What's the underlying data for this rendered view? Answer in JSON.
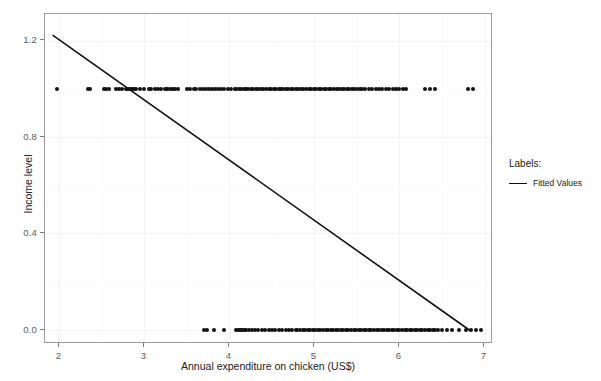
{
  "chart_data": {
    "type": "scatter",
    "title": "",
    "xlabel": "Annual expenditure on chicken (US$)",
    "ylabel": "Income level",
    "xlim": [
      1.83,
      7.1
    ],
    "ylim": [
      -0.06,
      1.31
    ],
    "xticks": [
      2,
      3,
      4,
      5,
      6,
      7
    ],
    "xtick_labels": [
      "2",
      "3",
      "4",
      "5",
      "6",
      "7"
    ],
    "yticks": [
      0.0,
      0.4,
      0.8,
      1.2
    ],
    "ytick_labels": [
      "0.0",
      "0.4",
      "0.8",
      "1.2"
    ],
    "grid": true,
    "legend_position": "right",
    "legend_title": "Labels:",
    "series": [
      {
        "name": "Observations",
        "type": "scatter",
        "marker": "filled-circle",
        "color": "#111111",
        "points_y1": [
          1.97,
          2.33,
          2.36,
          2.52,
          2.55,
          2.58,
          2.66,
          2.7,
          2.73,
          2.78,
          2.8,
          2.82,
          2.84,
          2.86,
          2.88,
          2.9,
          2.95,
          3.0,
          3.05,
          3.08,
          3.12,
          3.16,
          3.2,
          3.24,
          3.26,
          3.28,
          3.31,
          3.33,
          3.36,
          3.4,
          3.5,
          3.54,
          3.58,
          3.61,
          3.65,
          3.69,
          3.72,
          3.76,
          3.79,
          3.83,
          3.86,
          3.9,
          3.94,
          3.98,
          4.02,
          4.06,
          4.08,
          4.11,
          4.14,
          4.17,
          4.2,
          4.22,
          4.25,
          4.28,
          4.31,
          4.34,
          4.37,
          4.4,
          4.43,
          4.46,
          4.49,
          4.52,
          4.55,
          4.58,
          4.61,
          4.63,
          4.66,
          4.69,
          4.72,
          4.75,
          4.78,
          4.81,
          4.84,
          4.87,
          4.9,
          4.93,
          4.96,
          4.99,
          5.02,
          5.05,
          5.08,
          5.11,
          5.14,
          5.17,
          5.2,
          5.23,
          5.26,
          5.29,
          5.32,
          5.35,
          5.38,
          5.41,
          5.44,
          5.47,
          5.5,
          5.53,
          5.56,
          5.6,
          5.64,
          5.68,
          5.72,
          5.76,
          5.8,
          5.84,
          5.88,
          5.92,
          5.96,
          6.0,
          6.04,
          6.08,
          6.3,
          6.36,
          6.42,
          6.8,
          6.86
        ],
        "points_y0": [
          3.7,
          3.74,
          3.82,
          3.93,
          4.08,
          4.1,
          4.12,
          4.14,
          4.16,
          4.18,
          4.2,
          4.23,
          4.26,
          4.3,
          4.34,
          4.38,
          4.42,
          4.46,
          4.5,
          4.54,
          4.58,
          4.62,
          4.66,
          4.7,
          4.74,
          4.78,
          4.8,
          4.83,
          4.86,
          4.89,
          4.92,
          4.95,
          4.98,
          5.01,
          5.04,
          5.07,
          5.1,
          5.13,
          5.16,
          5.19,
          5.22,
          5.25,
          5.28,
          5.31,
          5.34,
          5.37,
          5.4,
          5.43,
          5.46,
          5.49,
          5.52,
          5.55,
          5.58,
          5.61,
          5.64,
          5.67,
          5.7,
          5.73,
          5.76,
          5.79,
          5.82,
          5.85,
          5.88,
          5.91,
          5.94,
          5.97,
          6.0,
          6.03,
          6.06,
          6.09,
          6.12,
          6.15,
          6.18,
          6.21,
          6.24,
          6.27,
          6.3,
          6.33,
          6.36,
          6.39,
          6.42,
          6.45,
          6.5,
          6.56,
          6.62,
          6.7,
          6.78,
          6.84,
          6.9,
          6.96
        ]
      },
      {
        "name": "Fitted Values",
        "type": "line",
        "color": "#111111",
        "x": [
          1.92,
          6.86
        ],
        "y": [
          1.222,
          -0.012
        ]
      }
    ]
  },
  "legend": {
    "title": "Labels:",
    "entries": [
      {
        "label": "Fitted Values",
        "color": "#111111",
        "key": "line"
      }
    ]
  },
  "axes": {
    "x_title": "Annual expenditure on chicken (US$)",
    "y_title": "Income level"
  }
}
